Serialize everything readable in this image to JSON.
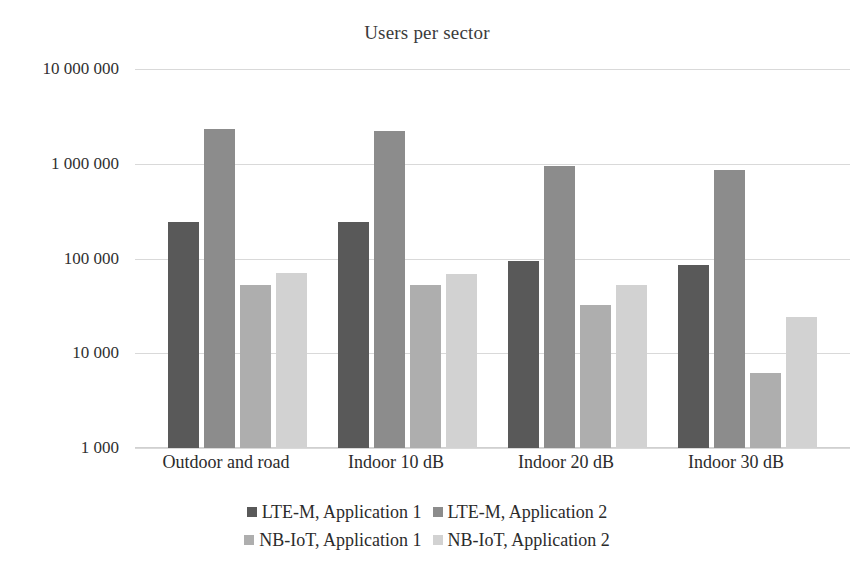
{
  "chart_data": {
    "type": "bar",
    "title": "Users per sector",
    "xlabel": "",
    "ylabel": "",
    "yscale": "log",
    "ylim": [
      1000,
      10000000
    ],
    "grid": true,
    "legend_position": "bottom",
    "ytick_labels": [
      "10 000 000",
      "1 000 000",
      "100 000",
      "10 000",
      "1 000"
    ],
    "ytick_values": [
      10000000,
      1000000,
      100000,
      10000,
      1000
    ],
    "categories": [
      "Outdoor and road",
      "Indoor 10 dB",
      "Indoor 20 dB",
      "Indoor 30 dB"
    ],
    "series": [
      {
        "name": "LTE-M, Application 1",
        "color": "#595959",
        "values": [
          240000,
          245000,
          95000,
          85000
        ]
      },
      {
        "name": "LTE-M, Application 2",
        "color": "#8c8c8c",
        "values": [
          2300000,
          2200000,
          950000,
          850000
        ]
      },
      {
        "name": "NB-IoT, Application 1",
        "color": "#aeaeae",
        "values": [
          52000,
          52000,
          32000,
          6200
        ]
      },
      {
        "name": "NB-IoT, Application 2",
        "color": "#d2d2d2",
        "values": [
          70000,
          68000,
          53000,
          24000
        ]
      }
    ]
  },
  "style": {
    "background": "#ffffff",
    "gridline_color": "#d9d9d9",
    "text_color": "#2b2b2b",
    "title_color": "#3b3b3b"
  }
}
